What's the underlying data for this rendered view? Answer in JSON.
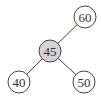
{
  "diagram": {
    "type": "tree",
    "nodes": [
      {
        "id": "n45",
        "label": "45",
        "x": 50,
        "y": 51,
        "r": 11,
        "fill": "#d3d3d3",
        "highlighted": true
      },
      {
        "id": "n60",
        "label": "60",
        "x": 85,
        "y": 17,
        "r": 11,
        "fill": "#ffffff"
      },
      {
        "id": "n40",
        "label": "40",
        "x": 19,
        "y": 82,
        "r": 11,
        "fill": "#ffffff"
      },
      {
        "id": "n50",
        "label": "50",
        "x": 84,
        "y": 82,
        "r": 11,
        "fill": "#ffffff"
      }
    ],
    "edges": [
      {
        "from": "n45",
        "to": "n60"
      },
      {
        "from": "n45",
        "to": "n40"
      },
      {
        "from": "n45",
        "to": "n50"
      }
    ],
    "stroke": "#444444"
  }
}
